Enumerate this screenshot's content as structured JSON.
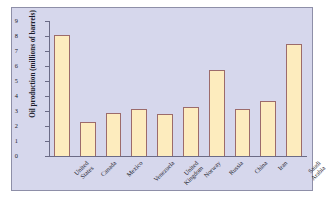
{
  "chart_data": {
    "type": "bar",
    "title": "",
    "xlabel": "",
    "ylabel": "Oil production (millions of barrels)",
    "categories": [
      "United States",
      "Canada",
      "Mexico",
      "Venezuela",
      "United Kingdom",
      "Norway",
      "Russia",
      "China",
      "Iran",
      "Saudi Arabia"
    ],
    "values": [
      8.05,
      2.25,
      2.85,
      3.15,
      2.8,
      3.3,
      5.75,
      3.15,
      3.65,
      7.5
    ],
    "ylim": [
      0,
      9
    ],
    "yticks": [
      "0",
      "1",
      "2",
      "3",
      "4",
      "5",
      "6",
      "7",
      "8",
      "9"
    ],
    "grid": false,
    "legend": null,
    "bar_fill": "#fdecbe",
    "bar_edge": "#9c6b6b",
    "panel_background": "#d6d7ec",
    "figure_background": "#ffffff",
    "axis_color": "#6b6b86",
    "text_color": "#1b1b2b"
  }
}
